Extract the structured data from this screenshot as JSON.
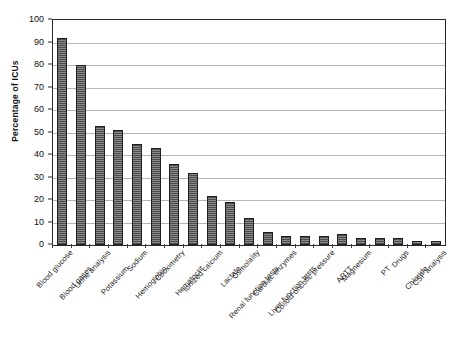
{
  "chart_data": {
    "type": "bar",
    "title": "",
    "xlabel": "",
    "ylabel": "Percentage of ICUs",
    "ylim": [
      0,
      100
    ],
    "ytick_step": 10,
    "yticks": [
      0,
      10,
      20,
      30,
      40,
      50,
      60,
      70,
      80,
      90,
      100
    ],
    "grid": true,
    "legend": "none",
    "orientation": "vertical",
    "bar_color": "#6e6e6e",
    "bar_edge_color": "#1f1f1f",
    "background_color": "#ffffff",
    "gridline_color": "#8f8f8f",
    "axis_color": "#2a2a2a",
    "categories": [
      "Blood glucose",
      "Blood gases",
      "Urine analysis",
      "Potassium",
      "Sodium",
      "Hemoglobin",
      "Cooximetry",
      "Hematocrit",
      "Ionized calcium",
      "Lactate",
      "Osmolality",
      "Renal function tests",
      "Cardiac enzymes",
      "Liver function tests",
      "Colloid oncotic pressure",
      "APTT",
      "Magnesium",
      "PT",
      "Drugs",
      "Chloride",
      "CSF analysis"
    ],
    "values": [
      92,
      80,
      53,
      51,
      45,
      43,
      36,
      32,
      22,
      19,
      12,
      6,
      4,
      4,
      4,
      5,
      3,
      3,
      3,
      2,
      2
    ],
    "label_rows": [
      0,
      1,
      0,
      1,
      0,
      1,
      0,
      1,
      0,
      1,
      0,
      1,
      0,
      1,
      0,
      1,
      0,
      1,
      0,
      1,
      0
    ]
  }
}
